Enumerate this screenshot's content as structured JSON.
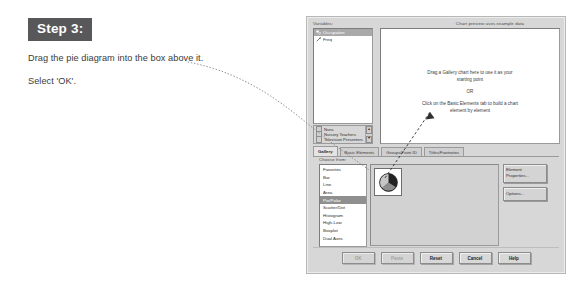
{
  "instructions": {
    "step_badge": "Step 3:",
    "line1": "Drag the pie diagram into the box above it.",
    "line2": "Select 'OK'."
  },
  "dialog": {
    "variables": {
      "label": "Variables:",
      "items": [
        {
          "name": "Occupation",
          "icon": "nominal-variable-icon",
          "selected": true
        },
        {
          "name": "Freq",
          "icon": "scale-variable-icon",
          "selected": false
        }
      ]
    },
    "values_list": {
      "items": [
        {
          "name": "Nuns",
          "icon": "category-swatch-icon"
        },
        {
          "name": "Nursery Teachers",
          "icon": "category-swatch-icon"
        },
        {
          "name": "Television Presenters",
          "icon": "category-swatch-icon"
        }
      ],
      "scroll_up": "▲",
      "scroll_down": "▼"
    },
    "preview": {
      "label": "Chart preview uses example data",
      "line1": "Drag a Gallery chart here to use it as your",
      "line2": "starting point",
      "or": "OR",
      "line3": "Click on the Basic Elements tab to build a chart",
      "line4": "element by element"
    },
    "tabs": [
      {
        "label": "Gallery",
        "active": true
      },
      {
        "label": "Basic Elements",
        "active": false
      },
      {
        "label": "Groups/Point ID",
        "active": false
      },
      {
        "label": "Titles/Footnotes",
        "active": false
      }
    ],
    "gallery": {
      "choose_label": "Choose from:",
      "items": [
        {
          "label": "Favorites",
          "selected": false
        },
        {
          "label": "Bar",
          "selected": false
        },
        {
          "label": "Line",
          "selected": false
        },
        {
          "label": "Area",
          "selected": false
        },
        {
          "label": "Pie/Polar",
          "selected": true
        },
        {
          "label": "Scatter/Dot",
          "selected": false
        },
        {
          "label": "Histogram",
          "selected": false
        },
        {
          "label": "High-Low",
          "selected": false
        },
        {
          "label": "Boxplot",
          "selected": false
        },
        {
          "label": "Dual Axes",
          "selected": false
        }
      ],
      "thumbnail": "pie-chart-thumbnail"
    },
    "side_buttons": [
      {
        "label": "Element Properties...",
        "name": "element-properties-button"
      },
      {
        "label": "Options...",
        "name": "options-button"
      }
    ],
    "bottom_buttons": [
      {
        "label": "OK",
        "disabled": true
      },
      {
        "label": "Paste",
        "disabled": true
      },
      {
        "label": "Reset",
        "disabled": false
      },
      {
        "label": "Cancel",
        "disabled": false
      },
      {
        "label": "Help",
        "disabled": false
      }
    ]
  },
  "colors": {
    "badge_bg": "#58585a",
    "dialog_bg": "#d7d7d7",
    "selection_bg": "#8f8f8f",
    "pie_dark": "#2b2b2b",
    "pie_mid": "#8f8f8f",
    "pie_light": "#bdbdbd"
  }
}
